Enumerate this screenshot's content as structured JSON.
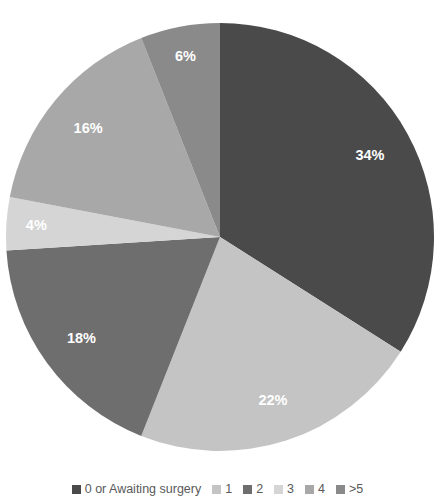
{
  "chart_data": {
    "type": "pie",
    "title": "",
    "xlabel": "",
    "ylabel": "",
    "legend_position": "bottom",
    "grid": false,
    "start_angle_deg": 0,
    "direction": "clockwise",
    "categories": [
      "0 or Awaiting surgery",
      "1",
      "2",
      "3",
      "4",
      ">5"
    ],
    "values": [
      34,
      22,
      18,
      4,
      16,
      6
    ],
    "labels": [
      "34%",
      "22%",
      "18%",
      "4%",
      "16%",
      "6%"
    ],
    "colors": [
      "#4a4a4a",
      "#c4c4c4",
      "#6e6e6e",
      "#d5d5d5",
      "#a8a8a8",
      "#8a8a8a"
    ],
    "slices": [
      {
        "category": "0 or Awaiting surgery",
        "value": 34,
        "label": "34%",
        "color": "#4a4a4a"
      },
      {
        "category": "1",
        "value": 22,
        "label": "22%",
        "color": "#c4c4c4"
      },
      {
        "category": "2",
        "value": 18,
        "label": "18%",
        "color": "#6e6e6e"
      },
      {
        "category": "3",
        "value": 4,
        "label": "4%",
        "color": "#d5d5d5"
      },
      {
        "category": "4",
        "value": 16,
        "label": "16%",
        "color": "#a8a8a8"
      },
      {
        "category": ">5",
        "value": 6,
        "label": "6%",
        "color": "#8a8a8a"
      }
    ]
  },
  "legend": {
    "items": [
      {
        "label": "0 or Awaiting surgery",
        "color": "#4a4a4a"
      },
      {
        "label": "1",
        "color": "#c4c4c4"
      },
      {
        "label": "2",
        "color": "#6e6e6e"
      },
      {
        "label": "3",
        "color": "#d5d5d5"
      },
      {
        "label": "4",
        "color": "#a8a8a8"
      },
      {
        "label": ">5",
        "color": "#8a8a8a"
      }
    ]
  }
}
